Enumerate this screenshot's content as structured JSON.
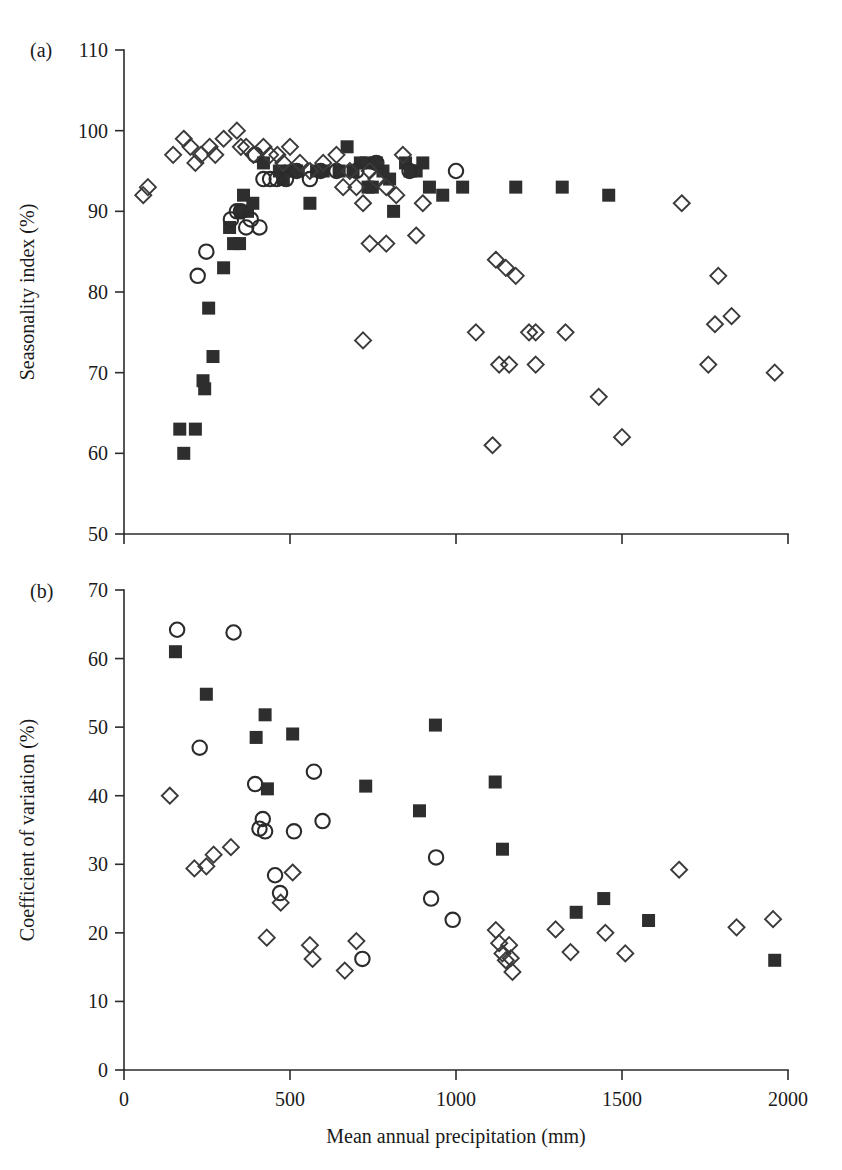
{
  "figure": {
    "panels": [
      {
        "id": "a",
        "label": "(a)"
      },
      {
        "id": "b",
        "label": "(b)"
      }
    ],
    "x_axis_title": "Mean annual precipitation (mm)",
    "colors": {
      "axis": "#2b2b2b",
      "filled_square": "#2e2e2e",
      "open_circle": "#2b2b2b",
      "open_diamond": "#3a3a3a",
      "background": "#ffffff"
    }
  },
  "chart_data": [
    {
      "type": "scatter",
      "panel": "(a)",
      "title": "",
      "xlabel": "Mean annual precipitation (mm)",
      "ylabel": "Seasonality index (%)",
      "xlim": [
        0,
        2000
      ],
      "ylim": [
        50,
        110
      ],
      "xticks": [
        0,
        500,
        1000,
        1500,
        2000
      ],
      "yticks": [
        50,
        60,
        70,
        80,
        90,
        100,
        110
      ],
      "grid": false,
      "legend": "none",
      "series": [
        {
          "name": "filled-square",
          "marker": "filled square",
          "points": [
            [
              168,
              63
            ],
            [
              180,
              60
            ],
            [
              215,
              63
            ],
            [
              238,
              69
            ],
            [
              243,
              68
            ],
            [
              255,
              78
            ],
            [
              268,
              72
            ],
            [
              300,
              83
            ],
            [
              318,
              88
            ],
            [
              330,
              86
            ],
            [
              348,
              86
            ],
            [
              352,
              90
            ],
            [
              360,
              92
            ],
            [
              372,
              90
            ],
            [
              388,
              91
            ],
            [
              420,
              96
            ],
            [
              468,
              95
            ],
            [
              480,
              94
            ],
            [
              500,
              95
            ],
            [
              520,
              95
            ],
            [
              560,
              91
            ],
            [
              580,
              95
            ],
            [
              600,
              95
            ],
            [
              648,
              95
            ],
            [
              672,
              98
            ],
            [
              690,
              95
            ],
            [
              712,
              96
            ],
            [
              730,
              96
            ],
            [
              735,
              93
            ],
            [
              748,
              93
            ],
            [
              760,
              96
            ],
            [
              780,
              95
            ],
            [
              800,
              94
            ],
            [
              812,
              90
            ],
            [
              848,
              96
            ],
            [
              862,
              95
            ],
            [
              880,
              95
            ],
            [
              900,
              96
            ],
            [
              920,
              93
            ],
            [
              960,
              92
            ],
            [
              1020,
              93
            ],
            [
              1180,
              93
            ],
            [
              1320,
              93
            ],
            [
              1460,
              92
            ]
          ]
        },
        {
          "name": "open-circle",
          "marker": "open circle",
          "points": [
            [
              222,
              82
            ],
            [
              248,
              85
            ],
            [
              322,
              89
            ],
            [
              340,
              90
            ],
            [
              352,
              90
            ],
            [
              368,
              88
            ],
            [
              382,
              89
            ],
            [
              395,
              97
            ],
            [
              408,
              88
            ],
            [
              420,
              94
            ],
            [
              440,
              94
            ],
            [
              460,
              94
            ],
            [
              488,
              94
            ],
            [
              520,
              95
            ],
            [
              560,
              94
            ],
            [
              592,
              95
            ],
            [
              640,
              95
            ],
            [
              700,
              95
            ],
            [
              760,
              96
            ],
            [
              860,
              95
            ],
            [
              1000,
              95
            ]
          ]
        },
        {
          "name": "open-diamond",
          "marker": "open diamond",
          "points": [
            [
              58,
              92
            ],
            [
              72,
              93
            ],
            [
              148,
              97
            ],
            [
              180,
              99
            ],
            [
              200,
              98
            ],
            [
              215,
              96
            ],
            [
              232,
              97
            ],
            [
              258,
              98
            ],
            [
              275,
              97
            ],
            [
              300,
              99
            ],
            [
              340,
              100
            ],
            [
              352,
              98
            ],
            [
              368,
              98
            ],
            [
              390,
              97
            ],
            [
              420,
              98
            ],
            [
              440,
              97
            ],
            [
              462,
              97
            ],
            [
              480,
              96
            ],
            [
              500,
              98
            ],
            [
              530,
              96
            ],
            [
              560,
              95
            ],
            [
              600,
              96
            ],
            [
              640,
              97
            ],
            [
              660,
              93
            ],
            [
              680,
              95
            ],
            [
              700,
              93
            ],
            [
              720,
              91
            ],
            [
              740,
              95
            ],
            [
              760,
              94
            ],
            [
              790,
              93
            ],
            [
              820,
              92
            ],
            [
              840,
              97
            ],
            [
              900,
              91
            ],
            [
              740,
              86
            ],
            [
              790,
              86
            ],
            [
              880,
              87
            ],
            [
              1120,
              84
            ],
            [
              1150,
              83
            ],
            [
              1180,
              82
            ],
            [
              1240,
              75
            ],
            [
              1680,
              91
            ],
            [
              1790,
              82
            ],
            [
              1830,
              77
            ],
            [
              1780,
              76
            ],
            [
              720,
              74
            ],
            [
              1060,
              75
            ],
            [
              1220,
              75
            ],
            [
              1330,
              75
            ],
            [
              1130,
              71
            ],
            [
              1160,
              71
            ],
            [
              1240,
              71
            ],
            [
              1430,
              67
            ],
            [
              1500,
              62
            ],
            [
              1110,
              61
            ],
            [
              1760,
              71
            ],
            [
              1960,
              70
            ]
          ]
        }
      ]
    },
    {
      "type": "scatter",
      "panel": "(b)",
      "title": "",
      "xlabel": "Mean annual precipitation (mm)",
      "ylabel": "Coefficient of variation (%)",
      "xlim": [
        0,
        2000
      ],
      "ylim": [
        0,
        70
      ],
      "xticks": [
        0,
        500,
        1000,
        1500,
        2000
      ],
      "yticks": [
        0,
        10,
        20,
        30,
        40,
        50,
        60,
        70
      ],
      "grid": false,
      "legend": "none",
      "series": [
        {
          "name": "filled-square",
          "marker": "filled square",
          "points": [
            [
              155,
              61.0
            ],
            [
              248,
              54.8
            ],
            [
              398,
              48.5
            ],
            [
              425,
              51.8
            ],
            [
              432,
              41.0
            ],
            [
              508,
              49.0
            ],
            [
              728,
              41.4
            ],
            [
              890,
              37.8
            ],
            [
              938,
              50.3
            ],
            [
              1118,
              42.0
            ],
            [
              1140,
              32.2
            ],
            [
              1362,
              23.0
            ],
            [
              1445,
              25.0
            ],
            [
              1580,
              21.8
            ],
            [
              1960,
              16.0
            ]
          ]
        },
        {
          "name": "open-circle",
          "marker": "open circle",
          "points": [
            [
              160,
              64.2
            ],
            [
              330,
              63.8
            ],
            [
              395,
              41.7
            ],
            [
              228,
              47.0
            ],
            [
              408,
              35.2
            ],
            [
              418,
              36.6
            ],
            [
              425,
              34.8
            ],
            [
              455,
              28.4
            ],
            [
              470,
              25.8
            ],
            [
              512,
              34.8
            ],
            [
              572,
              43.5
            ],
            [
              598,
              36.3
            ],
            [
              718,
              16.2
            ],
            [
              940,
              31.0
            ],
            [
              925,
              25.0
            ],
            [
              990,
              21.9
            ]
          ]
        },
        {
          "name": "open-diamond",
          "marker": "open diamond",
          "points": [
            [
              138,
              40.0
            ],
            [
              212,
              29.4
            ],
            [
              248,
              29.7
            ],
            [
              270,
              31.4
            ],
            [
              322,
              32.5
            ],
            [
              472,
              24.4
            ],
            [
              508,
              28.8
            ],
            [
              430,
              19.3
            ],
            [
              560,
              18.2
            ],
            [
              568,
              16.2
            ],
            [
              665,
              14.5
            ],
            [
              700,
              18.8
            ],
            [
              1120,
              20.4
            ],
            [
              1130,
              18.5
            ],
            [
              1140,
              17.0
            ],
            [
              1150,
              16.0
            ],
            [
              1160,
              18.2
            ],
            [
              1165,
              16.3
            ],
            [
              1170,
              14.3
            ],
            [
              1300,
              20.5
            ],
            [
              1345,
              17.2
            ],
            [
              1450,
              20.0
            ],
            [
              1510,
              17.0
            ],
            [
              1672,
              29.2
            ],
            [
              1845,
              20.8
            ],
            [
              1955,
              22.0
            ]
          ]
        }
      ]
    }
  ]
}
